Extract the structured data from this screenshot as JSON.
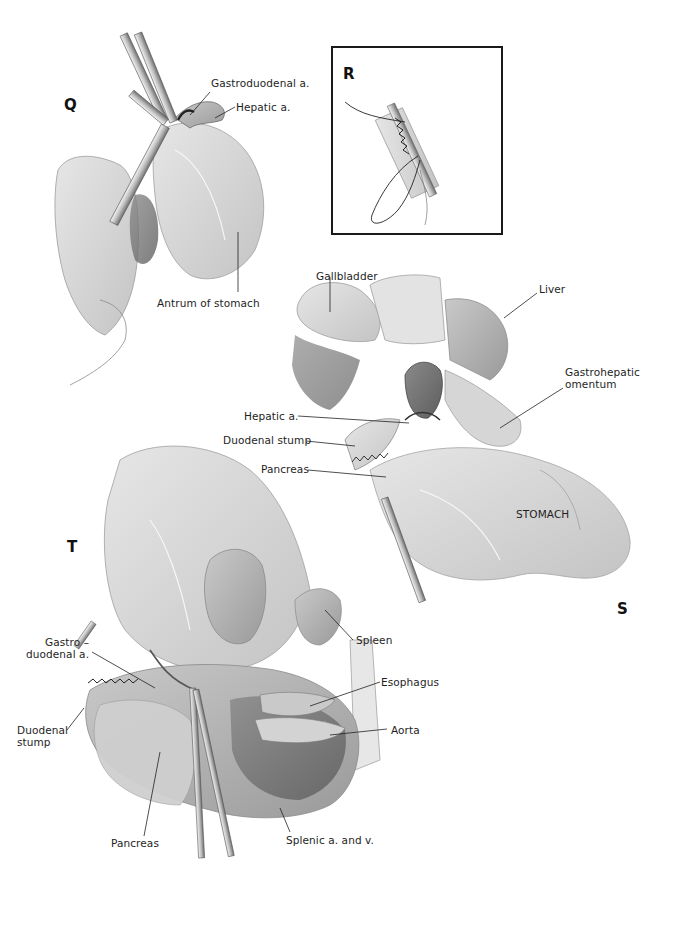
{
  "figure": {
    "panels": [
      {
        "id": "Q",
        "letter": "Q",
        "labels": [
          {
            "text": "Gastroduodenal a."
          },
          {
            "text": "Hepatic a."
          },
          {
            "text": "Antrum of stomach"
          }
        ]
      },
      {
        "id": "R",
        "letter": "R",
        "labels": []
      },
      {
        "id": "S",
        "letter": "S",
        "labels": [
          {
            "text": "Gallbladder"
          },
          {
            "text": "Liver"
          },
          {
            "text": "Gastrohepatic\nomentum"
          },
          {
            "text": "Hepatic a."
          },
          {
            "text": "Duodenal stump"
          },
          {
            "text": "Pancreas"
          },
          {
            "text": "STOMACH"
          }
        ]
      },
      {
        "id": "T",
        "letter": "T",
        "labels": [
          {
            "text": "Gastro –\nduodenal a."
          },
          {
            "text": "Duodenal\nstump"
          },
          {
            "text": "Pancreas"
          },
          {
            "text": "Spleen"
          },
          {
            "text": "Esophagus"
          },
          {
            "text": "Aorta"
          },
          {
            "text": "Splenic a. and v."
          }
        ]
      }
    ],
    "colors": {
      "ink": "#1a1a1a",
      "tissue_light": "#d9d9d9",
      "tissue_mid": "#b5b5b5",
      "tissue_dark": "#7d7d7d",
      "background": "#ffffff"
    }
  }
}
